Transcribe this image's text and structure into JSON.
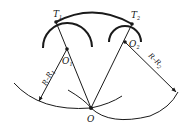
{
  "diagram": {
    "type": "geometric-construction",
    "points": {
      "T1": {
        "label": "T",
        "sub": "1"
      },
      "T2": {
        "label": "T",
        "sub": "2"
      },
      "O1": {
        "label": "O",
        "sub": "1"
      },
      "O2": {
        "label": "O",
        "sub": "2"
      },
      "O": {
        "label": "O"
      }
    },
    "dimensions": {
      "left": {
        "label": "R–R",
        "sub": "1"
      },
      "right": {
        "label": "R–R",
        "sub": "2"
      }
    },
    "colors": {
      "stroke": "#1a1a1a",
      "background": "#ffffff"
    }
  }
}
